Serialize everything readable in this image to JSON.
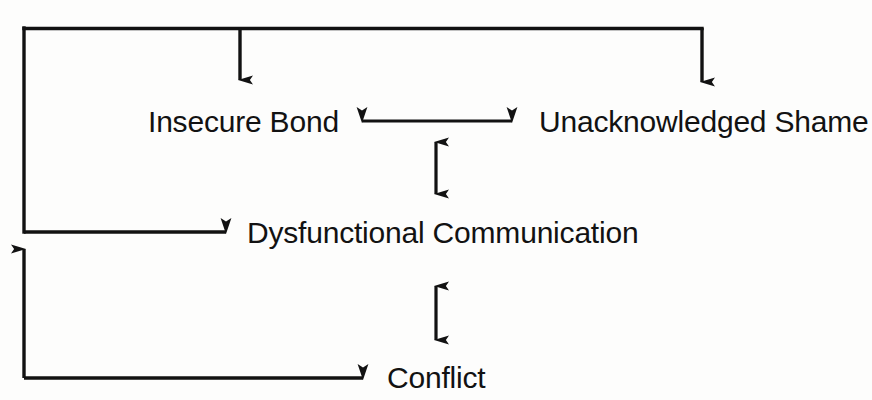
{
  "diagram": {
    "background_color": "#fdfdfc",
    "line_color": "#121212",
    "text_color": "#121212",
    "nodes": [
      {
        "id": "insecure_bond",
        "label": "Insecure Bond"
      },
      {
        "id": "unacknowledged_shame",
        "label": "Unacknowledged Shame"
      },
      {
        "id": "dysfunctional_communication",
        "label": "Dysfunctional Communication"
      },
      {
        "id": "conflict",
        "label": "Conflict"
      }
    ],
    "edges": [
      {
        "id": "e1",
        "from": "conflict",
        "to": "insecure_bond",
        "direction": "one-way",
        "style": "orthogonal-feedback"
      },
      {
        "id": "e2",
        "from": "conflict",
        "to": "unacknowledged_shame",
        "direction": "one-way",
        "style": "orthogonal-feedback"
      },
      {
        "id": "e3",
        "from": "insecure_bond",
        "to": "unacknowledged_shame",
        "direction": "two-way",
        "style": "straight-horizontal"
      },
      {
        "id": "e4",
        "from": "insecure_bond_shame_link",
        "to": "dysfunctional_communication",
        "direction": "two-way",
        "style": "straight-vertical"
      },
      {
        "id": "e5",
        "from": "conflict",
        "to": "dysfunctional_communication",
        "direction": "one-way",
        "style": "orthogonal-feedback"
      },
      {
        "id": "e6",
        "from": "dysfunctional_communication",
        "to": "conflict",
        "direction": "two-way",
        "style": "straight-vertical"
      }
    ]
  }
}
